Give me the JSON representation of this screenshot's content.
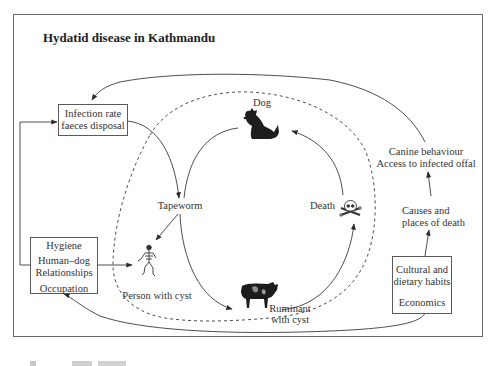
{
  "figure": {
    "title": "Hydatid disease in Kathmandu",
    "boxes": {
      "infection": {
        "lines": [
          "Infection rate",
          "faeces disposal"
        ]
      },
      "hygiene": {
        "lines": [
          "Hygiene",
          "Human–dog",
          "Relationships",
          "Occupation"
        ]
      },
      "cultural": {
        "lines": [
          "Cultural and",
          "dietary habits",
          "Economics"
        ]
      }
    },
    "nodes": {
      "dog": "Dog",
      "tapeworm": "Tapeworm",
      "person": "Person with cyst",
      "ruminant": [
        "Ruminant",
        "with cyst"
      ],
      "death": "Death"
    },
    "factors": {
      "canine": [
        "Canine behaviour",
        "Access to infected offal"
      ],
      "causes": [
        "Causes and",
        "places of death"
      ]
    },
    "icons": {
      "dog": "dog-silhouette-icon",
      "skeleton": "human-skeleton-icon",
      "cow": "cow-silhouette-icon",
      "skull": "skull-crossbones-icon"
    },
    "colors": {
      "line": "#3a3a3a",
      "frame": "#6a6a6a",
      "text": "#333333"
    }
  }
}
